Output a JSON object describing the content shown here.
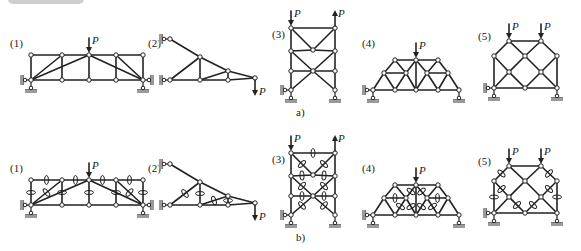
{
  "figure": {
    "header_badge": "",
    "row_a_caption": "a)",
    "row_b_caption": "b)",
    "load_symbol": "P",
    "colors": {
      "line": "#222222",
      "node_fill": "#ffffff",
      "ground": "#9a9a9a",
      "badge": "#cfcfcf"
    }
  },
  "structures": [
    {
      "id": 1,
      "label": "(1)",
      "label_pos": [
        10,
        47
      ],
      "nodes": [
        [
          31,
          55
        ],
        [
          62,
          55
        ],
        [
          89,
          55
        ],
        [
          116,
          55
        ],
        [
          143,
          55
        ],
        [
          31,
          80
        ],
        [
          62,
          80
        ],
        [
          89,
          80
        ],
        [
          116,
          80
        ],
        [
          143,
          80
        ]
      ],
      "members": [
        [
          0,
          1
        ],
        [
          1,
          2
        ],
        [
          2,
          3
        ],
        [
          3,
          4
        ],
        [
          5,
          6
        ],
        [
          6,
          7
        ],
        [
          7,
          8
        ],
        [
          8,
          9
        ],
        [
          0,
          5
        ],
        [
          1,
          6
        ],
        [
          2,
          7
        ],
        [
          3,
          8
        ],
        [
          4,
          9
        ],
        [
          5,
          1
        ],
        [
          5,
          2
        ],
        [
          9,
          2
        ],
        [
          9,
          3
        ]
      ],
      "zero_members_b": [
        [
          0,
          1
        ],
        [
          1,
          2
        ],
        [
          2,
          3
        ],
        [
          3,
          4
        ],
        [
          0,
          5
        ],
        [
          1,
          6
        ],
        [
          2,
          7
        ],
        [
          3,
          8
        ],
        [
          4,
          9
        ],
        [
          5,
          1
        ],
        [
          9,
          3
        ]
      ],
      "loads": [
        {
          "node": 2,
          "dir": "down"
        }
      ],
      "pin_supports": [
        5,
        9
      ],
      "wall_supports": [
        {
          "node": 5,
          "side": "left"
        },
        {
          "node": 9,
          "side": "right"
        }
      ]
    },
    {
      "id": 2,
      "label": "(2)",
      "label_pos": [
        148,
        47
      ],
      "nodes": [
        [
          170,
          39
        ],
        [
          200,
          57
        ],
        [
          228,
          71
        ],
        [
          255,
          78
        ],
        [
          170,
          80
        ],
        [
          200,
          80
        ],
        [
          228,
          80
        ]
      ],
      "members": [
        [
          0,
          1
        ],
        [
          1,
          2
        ],
        [
          2,
          3
        ],
        [
          4,
          5
        ],
        [
          5,
          6
        ],
        [
          6,
          3
        ],
        [
          4,
          1
        ],
        [
          1,
          5
        ],
        [
          5,
          2
        ],
        [
          2,
          6
        ]
      ],
      "zero_members_b": [
        [
          4,
          1
        ],
        [
          1,
          5
        ],
        [
          5,
          2
        ],
        [
          2,
          6
        ]
      ],
      "loads": [
        {
          "node": 3,
          "dir": "down-below"
        }
      ],
      "pin_supports": [],
      "wall_supports": [
        {
          "node": 0,
          "side": "left"
        },
        {
          "node": 4,
          "side": "left"
        }
      ]
    },
    {
      "id": 3,
      "label": "(3)",
      "label_pos": [
        272,
        38
      ],
      "nodes": [
        [
          291,
          28
        ],
        [
          335,
          28
        ],
        [
          291,
          51
        ],
        [
          313,
          50
        ],
        [
          335,
          51
        ],
        [
          291,
          71
        ],
        [
          313,
          71
        ],
        [
          335,
          71
        ],
        [
          291,
          90
        ],
        [
          335,
          90
        ]
      ],
      "members": [
        [
          0,
          1
        ],
        [
          0,
          2
        ],
        [
          1,
          4
        ],
        [
          2,
          5
        ],
        [
          4,
          7
        ],
        [
          5,
          8
        ],
        [
          7,
          9
        ],
        [
          2,
          3
        ],
        [
          3,
          4
        ],
        [
          0,
          3
        ],
        [
          1,
          3
        ],
        [
          5,
          6
        ],
        [
          6,
          7
        ],
        [
          2,
          6
        ],
        [
          4,
          6
        ],
        [
          6,
          8
        ],
        [
          6,
          9
        ]
      ],
      "zero_members_b": [
        [
          0,
          1
        ],
        [
          0,
          3
        ],
        [
          1,
          3
        ],
        [
          2,
          3
        ],
        [
          3,
          4
        ],
        [
          2,
          6
        ],
        [
          4,
          6
        ],
        [
          5,
          6
        ],
        [
          6,
          7
        ],
        [
          6,
          8
        ],
        [
          6,
          9
        ]
      ],
      "loads": [
        {
          "node": 0,
          "dir": "down"
        },
        {
          "node": 1,
          "dir": "up"
        }
      ],
      "pin_supports": [
        8,
        9
      ],
      "wall_supports": [
        {
          "node": 8,
          "side": "left"
        }
      ]
    },
    {
      "id": 4,
      "label": "(4)",
      "label_pos": [
        362,
        47
      ],
      "nodes": [
        [
          395,
          60
        ],
        [
          416,
          60
        ],
        [
          438,
          60
        ],
        [
          384,
          73
        ],
        [
          406,
          73
        ],
        [
          427,
          73
        ],
        [
          448,
          73
        ],
        [
          373,
          90
        ],
        [
          395,
          90
        ],
        [
          416,
          90
        ],
        [
          438,
          90
        ],
        [
          459,
          90
        ]
      ],
      "members": [
        [
          0,
          1
        ],
        [
          1,
          2
        ],
        [
          7,
          8
        ],
        [
          8,
          9
        ],
        [
          9,
          10
        ],
        [
          10,
          11
        ],
        [
          7,
          3
        ],
        [
          3,
          0
        ],
        [
          2,
          6
        ],
        [
          6,
          11
        ],
        [
          3,
          8
        ],
        [
          0,
          4
        ],
        [
          4,
          9
        ],
        [
          4,
          1
        ],
        [
          3,
          4
        ],
        [
          8,
          4
        ],
        [
          1,
          9
        ],
        [
          1,
          5
        ],
        [
          5,
          2
        ],
        [
          5,
          9
        ],
        [
          5,
          10
        ],
        [
          6,
          10
        ],
        [
          5,
          6
        ]
      ],
      "zero_members_b": [
        [
          3,
          4
        ],
        [
          8,
          4
        ],
        [
          4,
          1
        ],
        [
          4,
          9
        ],
        [
          1,
          5
        ],
        [
          5,
          9
        ],
        [
          5,
          10
        ],
        [
          5,
          6
        ]
      ],
      "loads": [
        {
          "node": 1,
          "dir": "down"
        }
      ],
      "pin_supports": [
        7,
        11
      ],
      "wall_supports": [
        {
          "node": 7,
          "side": "left"
        }
      ]
    },
    {
      "id": 5,
      "label": "(5)",
      "label_pos": [
        478,
        40
      ],
      "nodes": [
        [
          509,
          41
        ],
        [
          541,
          41
        ],
        [
          494,
          56
        ],
        [
          525,
          56
        ],
        [
          557,
          56
        ],
        [
          509,
          72
        ],
        [
          541,
          72
        ],
        [
          494,
          88
        ],
        [
          525,
          88
        ],
        [
          557,
          88
        ]
      ],
      "members": [
        [
          0,
          1
        ],
        [
          0,
          2
        ],
        [
          1,
          4
        ],
        [
          2,
          7
        ],
        [
          4,
          9
        ],
        [
          7,
          8
        ],
        [
          8,
          9
        ],
        [
          0,
          3
        ],
        [
          3,
          1
        ],
        [
          2,
          5
        ],
        [
          5,
          3
        ],
        [
          3,
          6
        ],
        [
          6,
          4
        ],
        [
          7,
          5
        ],
        [
          5,
          8
        ],
        [
          8,
          6
        ],
        [
          6,
          9
        ]
      ],
      "zero_members_b": [
        [
          0,
          2
        ],
        [
          1,
          4
        ],
        [
          2,
          7
        ],
        [
          4,
          9
        ],
        [
          2,
          5
        ],
        [
          6,
          4
        ],
        [
          5,
          8
        ],
        [
          8,
          6
        ]
      ],
      "loads": [
        {
          "node": 0,
          "dir": "down"
        },
        {
          "node": 1,
          "dir": "down"
        }
      ],
      "pin_supports": [
        7,
        9
      ],
      "wall_supports": [
        {
          "node": 7,
          "side": "left"
        }
      ]
    }
  ],
  "row_offsets": {
    "a": 0,
    "b": 125
  },
  "captions": {
    "a": {
      "text": "a)",
      "pos": [
        296,
        116
      ]
    },
    "b": {
      "text": "b)",
      "pos": [
        296,
        241
      ]
    }
  }
}
